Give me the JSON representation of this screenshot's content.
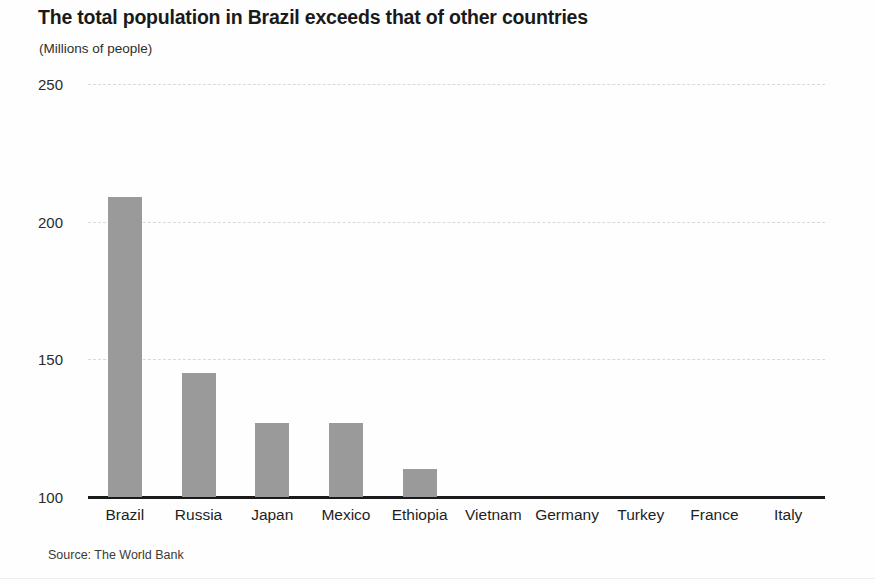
{
  "chart_data": {
    "type": "bar",
    "title": "The total population in Brazil exceeds that of other countries",
    "subtitle": "(Millions of people)",
    "xlabel": "",
    "ylabel": "(Millions of people)",
    "categories": [
      "Brazil",
      "Russia",
      "Japan",
      "Mexico",
      "Ethiopia",
      "Vietnam",
      "Germany",
      "Turkey",
      "France",
      "Italy"
    ],
    "values": [
      209,
      145,
      127,
      127,
      110,
      null,
      null,
      null,
      null,
      null
    ],
    "ylim": [
      100,
      250
    ],
    "yticks": [
      100,
      150,
      200,
      250
    ],
    "ytick_labels": [
      "100",
      "150",
      "200",
      "250"
    ],
    "grid": true,
    "grid_style": "dashed-horizontal",
    "legend": "none",
    "bar_color": "#9a9a9a",
    "axis_color": "#1a1a1a",
    "grid_color": "#d9d9dd",
    "note": "Bars for Vietnam, Germany, Turkey, France and Italy fall below the truncated axis baseline of 100 and are not visible.",
    "source": "Source: The World Bank"
  }
}
